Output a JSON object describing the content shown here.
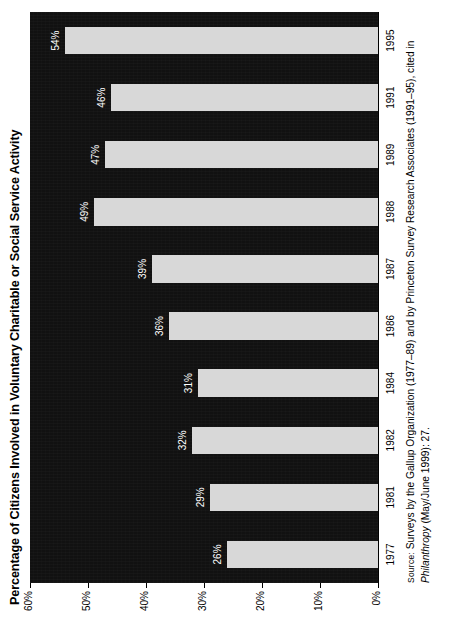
{
  "chart_data": {
    "type": "bar",
    "orientation": "vertical",
    "title": "Percentage of Citizens Involved in Voluntary Charitable or Social Service Activity",
    "xlabel": "",
    "ylabel": "",
    "categories": [
      "1977",
      "1981",
      "1982",
      "1984",
      "1986",
      "1987",
      "1988",
      "1989",
      "1991",
      "1995"
    ],
    "values": [
      26,
      29,
      32,
      31,
      36,
      39,
      49,
      47,
      46,
      54
    ],
    "data_labels": [
      "26%",
      "29%",
      "32%",
      "31%",
      "36%",
      "39%",
      "49%",
      "47%",
      "46%",
      "54%"
    ],
    "ylim": [
      0,
      60
    ],
    "ytick_values": [
      0,
      10,
      20,
      30,
      40,
      50,
      60
    ],
    "ytick_labels": [
      "0%",
      "10%",
      "20%",
      "30%",
      "40%",
      "50%",
      "60%"
    ],
    "grid": false,
    "legend": null,
    "plot_background_color": "#111111",
    "bar_color": "#d8d8d8",
    "data_label_color": "#ffffff",
    "axis_text_color": "#000000",
    "figure_rotation_degrees": -90
  },
  "source": {
    "label": "Source:",
    "line1": "Surveys by the Gallup Organization (1977–89) and by Princeton Survey Research Associates (1991–95), cited in",
    "italic_title": "Philanthropy",
    "line2_rest": " (May/June 1999): 27."
  }
}
